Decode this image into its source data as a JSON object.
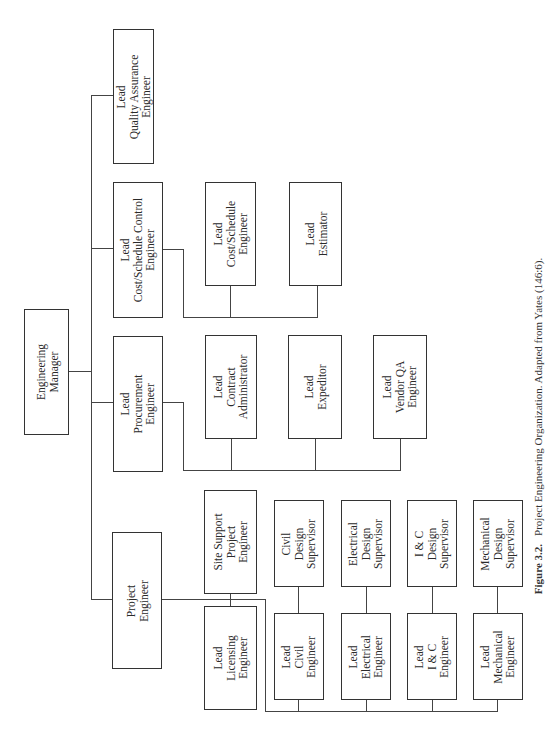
{
  "figure": {
    "number": "Figure 3.2.",
    "caption": "Project Engineering Organization. Adapted from Yates (146:6)."
  },
  "nodes": [
    {
      "id": "engineering-manager",
      "lines": [
        "Engineering",
        "Manager"
      ],
      "x": 24,
      "y": 309,
      "w": 45,
      "h": 126
    },
    {
      "id": "lead-quality-assurance-engineer",
      "lines": [
        "Lead",
        "Quality Assurance",
        "Engineer"
      ],
      "x": 113,
      "y": 29,
      "w": 41,
      "h": 135
    },
    {
      "id": "lead-cost-schedule-control-engineer",
      "lines": [
        "Lead",
        "Cost/Schedule Control",
        "Engineer"
      ],
      "x": 113,
      "y": 182,
      "w": 50,
      "h": 136
    },
    {
      "id": "lead-cost-schedule-engineer",
      "lines": [
        "Lead",
        "Cost/Schedule",
        "Engineer"
      ],
      "x": 205,
      "y": 182,
      "w": 51,
      "h": 104
    },
    {
      "id": "lead-estimator",
      "lines": [
        "Lead",
        "Estimator"
      ],
      "x": 289,
      "y": 182,
      "w": 53,
      "h": 104
    },
    {
      "id": "lead-procurement-engineer",
      "lines": [
        "Lead",
        "Procurement",
        "Engineer"
      ],
      "x": 113,
      "y": 336,
      "w": 50,
      "h": 136
    },
    {
      "id": "lead-contract-administrator",
      "lines": [
        "Lead",
        "Contract",
        "Administrator"
      ],
      "x": 205,
      "y": 335,
      "w": 52,
      "h": 104
    },
    {
      "id": "lead-expeditor",
      "lines": [
        "Lead",
        "Expeditor"
      ],
      "x": 288,
      "y": 335,
      "w": 54,
      "h": 104
    },
    {
      "id": "lead-vendor-qa-engineer",
      "lines": [
        "Lead",
        "Vendor QA",
        "Engineer"
      ],
      "x": 373,
      "y": 335,
      "w": 54,
      "h": 104
    },
    {
      "id": "project-engineer",
      "lines": [
        "Project",
        "Engineer"
      ],
      "x": 112,
      "y": 532,
      "w": 50,
      "h": 137
    },
    {
      "id": "site-support-project-engineer",
      "lines": [
        "Site Support",
        "Project",
        "Engineer"
      ],
      "x": 204,
      "y": 490,
      "w": 53,
      "h": 104
    },
    {
      "id": "lead-licensing-engineer",
      "lines": [
        "Lead",
        "Licensing",
        "Engineer"
      ],
      "x": 204,
      "y": 606,
      "w": 53,
      "h": 104
    },
    {
      "id": "civil-design-supervisor",
      "lines": [
        "Civil",
        "Design",
        "Supervisor"
      ],
      "x": 274,
      "y": 500,
      "w": 50,
      "h": 87
    },
    {
      "id": "lead-civil-engineer",
      "lines": [
        "Lead",
        "Civil",
        "Engineer"
      ],
      "x": 274,
      "y": 613,
      "w": 50,
      "h": 87
    },
    {
      "id": "electrical-design-supervisor",
      "lines": [
        "Electrical",
        "Design",
        "Supervisor"
      ],
      "x": 341,
      "y": 500,
      "w": 50,
      "h": 87
    },
    {
      "id": "lead-electrical-engineer",
      "lines": [
        "Lead",
        "Electrical",
        "Engineer"
      ],
      "x": 341,
      "y": 613,
      "w": 50,
      "h": 87
    },
    {
      "id": "i-and-c-design-supervisor",
      "lines": [
        "I & C",
        "Design",
        "Supervisor"
      ],
      "x": 407,
      "y": 500,
      "w": 50,
      "h": 87
    },
    {
      "id": "lead-i-and-c-engineer",
      "lines": [
        "Lead",
        "I & C",
        "Engineer"
      ],
      "x": 407,
      "y": 613,
      "w": 50,
      "h": 87
    },
    {
      "id": "mechanical-design-supervisor",
      "lines": [
        "Mechanical",
        "Design",
        "Supervisor"
      ],
      "x": 473,
      "y": 500,
      "w": 50,
      "h": 87
    },
    {
      "id": "lead-mechanical-engineer",
      "lines": [
        "Lead",
        "Mechanical",
        "Engineer"
      ],
      "x": 473,
      "y": 613,
      "w": 50,
      "h": 87
    }
  ],
  "edges": [
    {
      "from": "engineering-manager",
      "to": "lead-quality-assurance-engineer"
    },
    {
      "from": "engineering-manager",
      "to": "lead-cost-schedule-control-engineer"
    },
    {
      "from": "engineering-manager",
      "to": "lead-procurement-engineer"
    },
    {
      "from": "engineering-manager",
      "to": "project-engineer"
    },
    {
      "from": "lead-cost-schedule-control-engineer",
      "to": "lead-cost-schedule-engineer"
    },
    {
      "from": "lead-cost-schedule-control-engineer",
      "to": "lead-estimator"
    },
    {
      "from": "lead-procurement-engineer",
      "to": "lead-contract-administrator"
    },
    {
      "from": "lead-procurement-engineer",
      "to": "lead-expeditor"
    },
    {
      "from": "lead-procurement-engineer",
      "to": "lead-vendor-qa-engineer"
    },
    {
      "from": "project-engineer",
      "to": "site-support-project-engineer"
    },
    {
      "from": "project-engineer",
      "to": "lead-licensing-engineer"
    },
    {
      "from": "project-engineer",
      "to": "lead-civil-engineer"
    },
    {
      "from": "project-engineer",
      "to": "lead-electrical-engineer"
    },
    {
      "from": "project-engineer",
      "to": "lead-i-and-c-engineer"
    },
    {
      "from": "project-engineer",
      "to": "lead-mechanical-engineer"
    },
    {
      "from": "lead-civil-engineer",
      "to": "civil-design-supervisor"
    },
    {
      "from": "lead-electrical-engineer",
      "to": "electrical-design-supervisor"
    },
    {
      "from": "lead-i-and-c-engineer",
      "to": "i-and-c-design-supervisor"
    },
    {
      "from": "lead-mechanical-engineer",
      "to": "mechanical-design-supervisor"
    }
  ],
  "segments": [
    {
      "t": "h",
      "x": 68,
      "y": 371,
      "len": 24
    },
    {
      "t": "v",
      "x": 91,
      "y": 95,
      "len": 505
    },
    {
      "t": "h",
      "x": 91,
      "y": 95,
      "len": 22
    },
    {
      "t": "h",
      "x": 91,
      "y": 248,
      "len": 22
    },
    {
      "t": "h",
      "x": 91,
      "y": 402,
      "len": 22
    },
    {
      "t": "h",
      "x": 91,
      "y": 599,
      "len": 21
    },
    {
      "t": "h",
      "x": 162,
      "y": 249,
      "len": 21
    },
    {
      "t": "v",
      "x": 183,
      "y": 249,
      "len": 68
    },
    {
      "t": "h",
      "x": 183,
      "y": 317,
      "len": 135
    },
    {
      "t": "v",
      "x": 230,
      "y": 285,
      "len": 32
    },
    {
      "t": "v",
      "x": 317,
      "y": 285,
      "len": 32
    },
    {
      "t": "h",
      "x": 162,
      "y": 402,
      "len": 21
    },
    {
      "t": "v",
      "x": 183,
      "y": 402,
      "len": 68
    },
    {
      "t": "h",
      "x": 183,
      "y": 470,
      "len": 218
    },
    {
      "t": "v",
      "x": 231,
      "y": 438,
      "len": 32
    },
    {
      "t": "v",
      "x": 315,
      "y": 438,
      "len": 32
    },
    {
      "t": "v",
      "x": 400,
      "y": 438,
      "len": 32
    },
    {
      "t": "h",
      "x": 161,
      "y": 599,
      "len": 104
    },
    {
      "t": "v",
      "x": 230,
      "y": 593,
      "len": 14
    },
    {
      "t": "v",
      "x": 265,
      "y": 599,
      "len": 112
    },
    {
      "t": "h",
      "x": 265,
      "y": 711,
      "len": 233
    },
    {
      "t": "v",
      "x": 298,
      "y": 699,
      "len": 12
    },
    {
      "t": "v",
      "x": 366,
      "y": 699,
      "len": 12
    },
    {
      "t": "v",
      "x": 432,
      "y": 699,
      "len": 12
    },
    {
      "t": "v",
      "x": 497,
      "y": 699,
      "len": 12
    },
    {
      "t": "v",
      "x": 298,
      "y": 586,
      "len": 27
    },
    {
      "t": "v",
      "x": 366,
      "y": 586,
      "len": 27
    },
    {
      "t": "v",
      "x": 432,
      "y": 586,
      "len": 27
    },
    {
      "t": "v",
      "x": 497,
      "y": 586,
      "len": 27
    }
  ]
}
